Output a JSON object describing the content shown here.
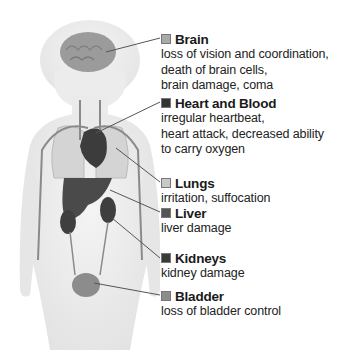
{
  "figure": {
    "organs": [
      {
        "id": "brain",
        "title": "Brain",
        "swatch": "#a9a9a9",
        "lines": [
          "loss of vision and coordination,",
          "death of brain cells,",
          "brain damage, coma"
        ]
      },
      {
        "id": "heart",
        "title": "Heart and Blood",
        "swatch": "#333333",
        "lines": [
          "irregular heartbeat,",
          "heart attack, decreased ability",
          "to carry oxygen"
        ]
      },
      {
        "id": "lungs",
        "title": "Lungs",
        "swatch": "#c8c8c8",
        "lines": [
          "irritation, suffocation"
        ]
      },
      {
        "id": "liver",
        "title": "Liver",
        "swatch": "#555555",
        "lines": [
          "liver damage"
        ]
      },
      {
        "id": "kidneys",
        "title": "Kidneys",
        "swatch": "#3a3a3a",
        "lines": [
          "kidney damage"
        ]
      },
      {
        "id": "bladder",
        "title": "Bladder",
        "swatch": "#8c8c8c",
        "lines": [
          "loss of bladder control"
        ]
      }
    ]
  }
}
